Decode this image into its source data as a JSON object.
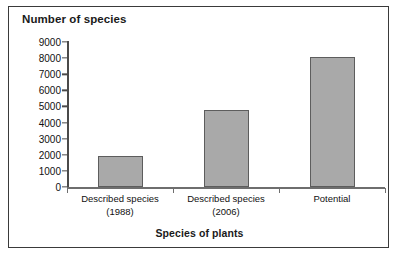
{
  "chart_data": {
    "type": "bar",
    "title": "Number of species",
    "xlabel": "Species of plants",
    "ylabel": "Number of species",
    "categories": [
      "Described species (1988)",
      "Described species (2006)",
      "Potential"
    ],
    "category_lines": [
      [
        "Described species",
        "(1988)"
      ],
      [
        "Described species",
        "(2006)"
      ],
      [
        "Potential",
        ""
      ]
    ],
    "values": [
      1900,
      4800,
      8100
    ],
    "ylim": [
      0,
      9000
    ],
    "yticks": [
      0,
      1000,
      2000,
      3000,
      4000,
      5000,
      6000,
      7000,
      8000,
      9000
    ],
    "ytick_labels": [
      "0",
      "1000",
      "2000",
      "3000",
      "4000",
      "5000",
      "6000",
      "7000",
      "8000",
      "9000"
    ],
    "grid": false,
    "legend": null,
    "bar_color": "#a9a9a9",
    "bar_edge_color": "#5d5d5d",
    "axis_color": "#4a4a4a",
    "frame_color": "#3a3a3a",
    "text_color": "#111111"
  }
}
